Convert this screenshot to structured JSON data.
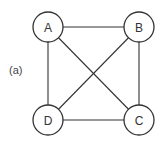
{
  "caption": "(a)",
  "graph": {
    "nodes": [
      {
        "id": "A",
        "label": "A",
        "x": 48,
        "y": 27
      },
      {
        "id": "B",
        "label": "B",
        "x": 139,
        "y": 27
      },
      {
        "id": "C",
        "label": "C",
        "x": 139,
        "y": 120
      },
      {
        "id": "D",
        "label": "D",
        "x": 48,
        "y": 120
      }
    ],
    "edges": [
      [
        "A",
        "B"
      ],
      [
        "A",
        "D"
      ],
      [
        "A",
        "C"
      ],
      [
        "B",
        "C"
      ],
      [
        "B",
        "D"
      ],
      [
        "D",
        "C"
      ]
    ],
    "node_radius": 15,
    "stroke_color": "#333333"
  }
}
